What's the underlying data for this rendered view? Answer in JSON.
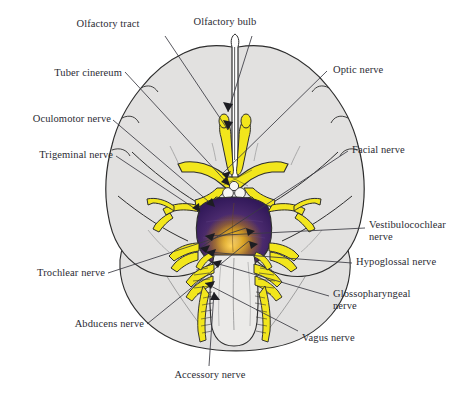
{
  "figure": {
    "kind": "anatomical-diagram",
    "background_color": "#ffffff",
    "palette": {
      "nerve_yellow": "#f2e61c",
      "nerve_yellow_edge": "#b5a900",
      "brain_gray": "#e2e1e0",
      "brain_gray_dark": "#d3d2d1",
      "outline": "#2d2d2d",
      "pons_purple": "#3c2161",
      "pons_purple_deep": "#2a1546",
      "pons_gold": "#f0b200",
      "pons_light": "#ffe38a",
      "medulla_gray": "#ebeae8",
      "label_text": "#2b2b33",
      "leader_line": "#3a3a42"
    }
  },
  "labels": [
    {
      "id": "olfactory-tract",
      "text": "Olfactory tract",
      "side": "top-left",
      "x": 108,
      "y": 24,
      "align": "c"
    },
    {
      "id": "olfactory-bulb",
      "text": "Olfactory bulb",
      "side": "top-right",
      "x": 215,
      "y": 22,
      "align": "c"
    },
    {
      "id": "tuber-cinereum",
      "text": "Tuber cinereum",
      "side": "left",
      "x": 55,
      "y": 67,
      "align": "l"
    },
    {
      "id": "optic-nerve",
      "text": "Optic nerve",
      "side": "right",
      "x": 332,
      "y": 66,
      "align": "r"
    },
    {
      "id": "oculomotor-nerve",
      "text": "Oculomotor nerve",
      "side": "left",
      "x": 24,
      "y": 115,
      "align": "l"
    },
    {
      "id": "trigeminal-nerve",
      "text": "Trigeminal nerve",
      "side": "left",
      "x": 31,
      "y": 151,
      "align": "l"
    },
    {
      "id": "facial-nerve",
      "text": "Facial nerve",
      "side": "right",
      "x": 351,
      "y": 146,
      "align": "r"
    },
    {
      "id": "vestibulocochlear-nerve",
      "text": "Vestibulocochlear\nnerve",
      "side": "right",
      "x": 368,
      "y": 222,
      "align": "r"
    },
    {
      "id": "hypoglossal-nerve",
      "text": "Hypoglossal nerve",
      "side": "right",
      "x": 355,
      "y": 258,
      "align": "r"
    },
    {
      "id": "trochlear-nerve",
      "text": "Trochlear nerve",
      "side": "left",
      "x": 18,
      "y": 269,
      "align": "l"
    },
    {
      "id": "glossopharyngeal-nerve",
      "text": "Glossopharyngeal\nnerve",
      "side": "right",
      "x": 332,
      "y": 291,
      "align": "r"
    },
    {
      "id": "abducens-nerve",
      "text": "Abducens nerve",
      "side": "left",
      "x": 62,
      "y": 320,
      "align": "l"
    },
    {
      "id": "vagus-nerve",
      "text": "Vagus nerve",
      "side": "bottom-right",
      "x": 301,
      "y": 334,
      "align": "r"
    },
    {
      "id": "accessory-nerve",
      "text": "Accessory nerve",
      "side": "bottom",
      "x": 154,
      "y": 371,
      "align": "c"
    }
  ],
  "structures": [
    {
      "id": "frontal-lobe-left",
      "name": "Left frontal lobe"
    },
    {
      "id": "frontal-lobe-right",
      "name": "Right frontal lobe"
    },
    {
      "id": "temporal-lobe-left",
      "name": "Left temporal lobe"
    },
    {
      "id": "temporal-lobe-right",
      "name": "Right temporal lobe"
    },
    {
      "id": "cerebellum",
      "name": "Cerebellum"
    },
    {
      "id": "pons",
      "name": "Pons"
    },
    {
      "id": "medulla-oblongata",
      "name": "Medulla oblongata"
    },
    {
      "id": "optic-chiasm",
      "name": "Optic chiasm"
    },
    {
      "id": "mammillary-bodies",
      "name": "Mammillary bodies"
    },
    {
      "id": "longitudinal-fissure",
      "name": "Longitudinal fissure"
    }
  ]
}
